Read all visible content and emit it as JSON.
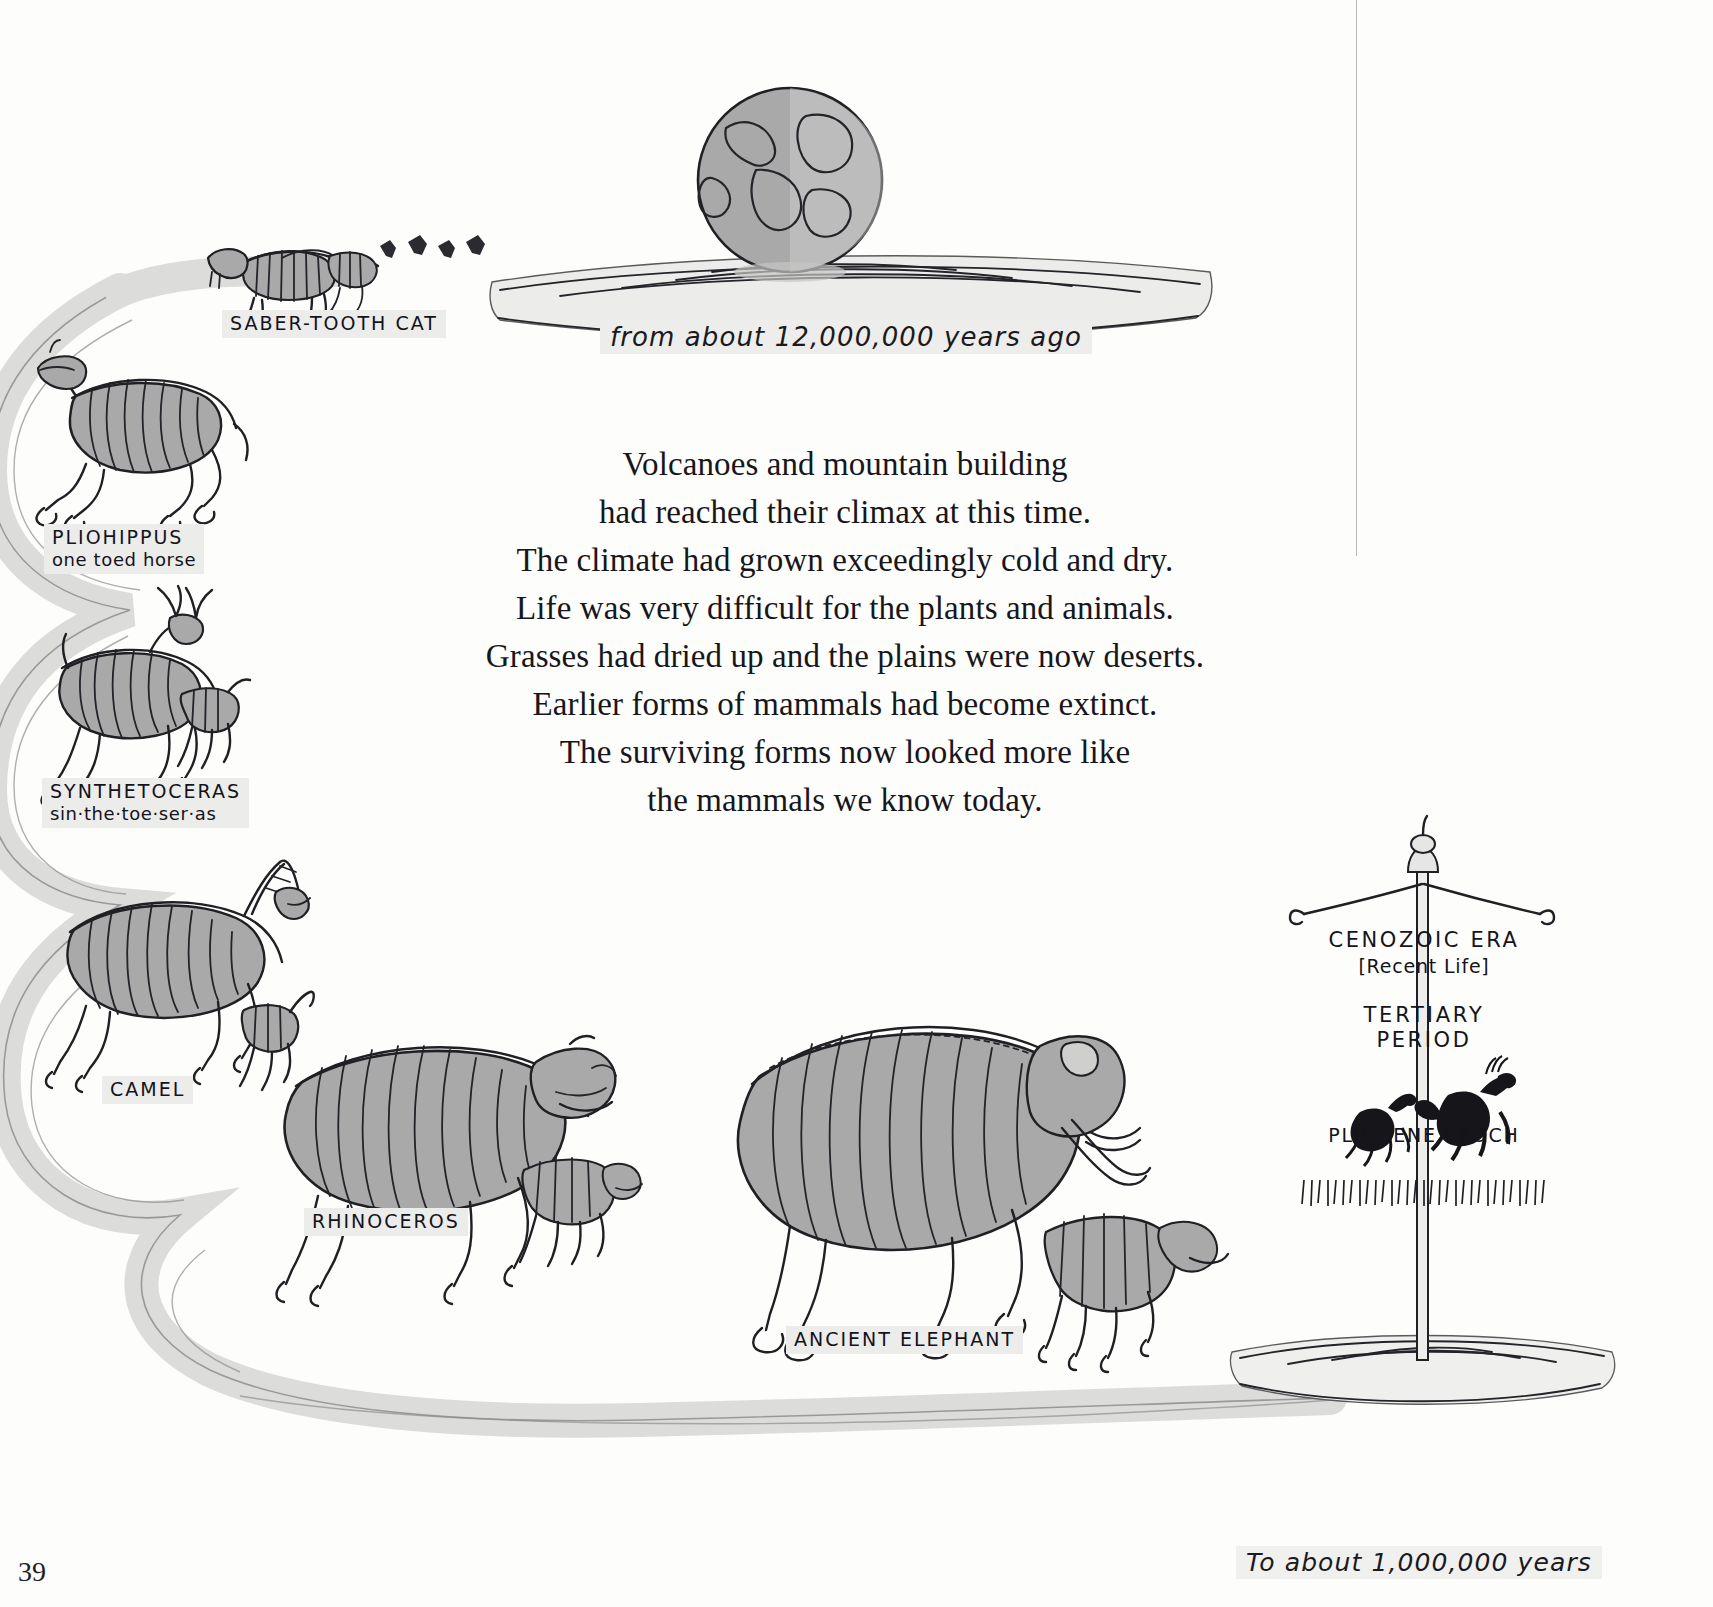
{
  "page": {
    "number": "39",
    "background_color": "#fdfdfc",
    "ink_color": "#1f1f24",
    "bone_fill_color": "#a9a9a9",
    "label_highlight_color": "#ececeb"
  },
  "era_caption": "from about 12,000,000 years ago",
  "bottom_caption": "To about 1,000,000 years",
  "poem": {
    "lines": [
      "Volcanoes and mountain building",
      "had reached their climax at this time.",
      "The climate had grown exceedingly cold and dry.",
      "Life was very difficult for the plants and animals.",
      "Grasses had dried up and the plains were now deserts.",
      "Earlier forms of mammals had become extinct.",
      "The surviving forms now looked more like",
      "the mammals we know today."
    ]
  },
  "specimens": [
    {
      "name": "saber-tooth-cat",
      "title": "SABER-TOOTH CAT",
      "pronunciation": ""
    },
    {
      "name": "pliohippus",
      "title": "PLIOHIPPUS",
      "pronunciation": "one toed horse"
    },
    {
      "name": "synthetoceras",
      "title": "SYNTHETOCERAS",
      "pronunciation": "sin·the·toe·ser·as"
    },
    {
      "name": "camel",
      "title": "CAMEL",
      "pronunciation": ""
    },
    {
      "name": "rhinoceros",
      "title": "RHINOCEROS",
      "pronunciation": ""
    },
    {
      "name": "ancient-elephant",
      "title": "ANCIENT ELEPHANT",
      "pronunciation": ""
    }
  ],
  "banner": {
    "era": "CENOZOIC ERA",
    "era_meaning": "[Recent Life]",
    "period_line1": "TERTIARY",
    "period_line2": "PERIOD",
    "epoch": "PLIOCENE EPOCH",
    "emblem": "running-horses-icon"
  }
}
